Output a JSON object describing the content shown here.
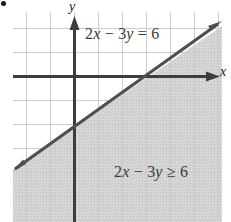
{
  "figure": {
    "bullet_marker": "●",
    "background_color": "#ffffff"
  },
  "axes": {
    "x_label": "x",
    "y_label": "y",
    "axis_color": "#3d3d3d",
    "grid_color": "#cfcfcf",
    "origin_px": {
      "x": 74,
      "y": 76
    },
    "grid_spacing_px": 24,
    "x_range_units": [
      -2.5,
      6.2
    ],
    "y_range_units": [
      -6.1,
      2.7
    ]
  },
  "labels": {
    "line_equation": "2x − 3y = 6",
    "inequality": "2x − 3y ≥ 6",
    "text_color": "#3a3a3a"
  },
  "chart_data": {
    "type": "line",
    "title": "",
    "subtitle": "",
    "xlabel": "x",
    "ylabel": "y",
    "xlim": [
      -2.5,
      6.2
    ],
    "ylim": [
      -6.1,
      2.7
    ],
    "grid": true,
    "grid_step": 1,
    "legend": "none",
    "series": [
      {
        "name": "2x - 3y = 6",
        "kind": "boundary-line",
        "equation": "2x - 3y = 6",
        "slope": 0.6666667,
        "y_intercept": -2,
        "x_intercept": 3,
        "line_style": "solid",
        "line_color": "#4a4a4a",
        "line_width_px": 3,
        "arrows": "both",
        "points": [
          {
            "x": 0,
            "y": -2
          },
          {
            "x": 3,
            "y": 0
          }
        ]
      }
    ],
    "shaded_region": {
      "name": "2x - 3y >= 6",
      "inequality": "2x - 3y >= 6",
      "side": "below-right of the line",
      "boundary_included": true,
      "fill_color": "#d2d2d2",
      "fill_opacity": 0.75,
      "label": "2x − 3y ≥ 6"
    },
    "annotations": [
      {
        "text": "2x − 3y = 6",
        "x": 0.5,
        "y": 1.9,
        "role": "line-equation"
      },
      {
        "text": "2x − 3y ≥ 6",
        "x": 1.9,
        "y": -4.0,
        "role": "region-inequality"
      }
    ]
  }
}
